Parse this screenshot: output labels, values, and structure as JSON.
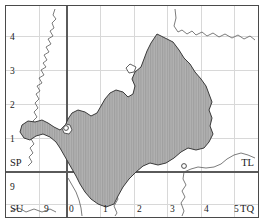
{
  "figure": {
    "kind": "ordnance-survey-grid-map"
  },
  "colors": {
    "frame": "#4a4a4a",
    "major_gridline": "#5a5a5a",
    "minor_gridline": "#d8d8d8",
    "region_fill": "#a9a9a9",
    "region_outline": "#3a3a3a",
    "coastline": "#555555",
    "label_text": "#1a1a1a",
    "background": "#ffffff"
  },
  "grid": {
    "easting_labels": [
      "0",
      "1",
      "2",
      "3",
      "4",
      "5"
    ],
    "northing_labels": [
      "1",
      "2",
      "3",
      "4"
    ],
    "pre_origin_easting_label": "9",
    "pre_origin_northing_label": "9",
    "major_vertical_at": "0",
    "major_horizontal_at": "0"
  },
  "squares": {
    "top_left": "SP",
    "top_right": "TL",
    "bottom_left": "SU",
    "bottom_right": "TQ"
  },
  "legend": {
    "shaded_region_note": "shaded study area",
    "hatch_style": "vertical-line hatch"
  }
}
